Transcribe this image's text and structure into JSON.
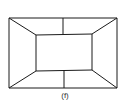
{
  "figure": {
    "label": "(f)",
    "stroke_color": "#1a1a1a",
    "background": "#ffffff",
    "outer_rect": {
      "x1": 9,
      "y1": 18,
      "x2": 117,
      "y2": 88
    },
    "inner_rect": {
      "x1": 36,
      "y1": 35,
      "x2": 92,
      "y2": 71
    },
    "dividers": [
      {
        "x1": 63,
        "y1": 18,
        "x2": 63,
        "y2": 35
      },
      {
        "x1": 64,
        "y1": 71,
        "x2": 64,
        "y2": 88
      }
    ]
  }
}
